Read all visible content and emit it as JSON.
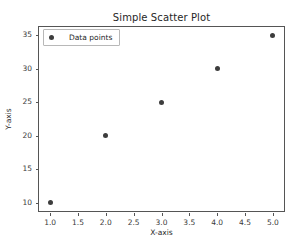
{
  "chart_data": {
    "type": "scatter",
    "title": "Simple Scatter Plot",
    "xlabel": "X-axis",
    "ylabel": "Y-axis",
    "x": [
      1,
      2,
      3,
      4,
      5
    ],
    "y": [
      10,
      20,
      25,
      30,
      35
    ],
    "points": [
      {
        "x": 1,
        "y": 10
      },
      {
        "x": 2,
        "y": 20
      },
      {
        "x": 3,
        "y": 25
      },
      {
        "x": 4,
        "y": 30
      },
      {
        "x": 5,
        "y": 35
      }
    ],
    "series": [
      {
        "name": "Data points",
        "marker": "circle",
        "color": "#3d3d3d",
        "x": [
          1,
          2,
          3,
          4,
          5
        ],
        "y": [
          10,
          20,
          25,
          30,
          35
        ]
      }
    ],
    "xlim": [
      0.8,
      5.2
    ],
    "ylim": [
      8.75,
      36.25
    ],
    "xticks": [
      1.0,
      1.5,
      2.0,
      2.5,
      3.0,
      3.5,
      4.0,
      4.5,
      5.0
    ],
    "xticklabels": [
      "1.0",
      "1.5",
      "2.0",
      "2.5",
      "3.0",
      "3.5",
      "4.0",
      "4.5",
      "5.0"
    ],
    "yticks": [
      10,
      15,
      20,
      25,
      30,
      35
    ],
    "yticklabels": [
      "10",
      "15",
      "20",
      "25",
      "30",
      "35"
    ],
    "grid": false,
    "legend": {
      "position": "upper left",
      "entries": [
        "Data points"
      ]
    },
    "colors": {
      "marker": "#3d3d3d",
      "axes": "#555555",
      "text": "#262626",
      "background": "#ffffff"
    }
  }
}
